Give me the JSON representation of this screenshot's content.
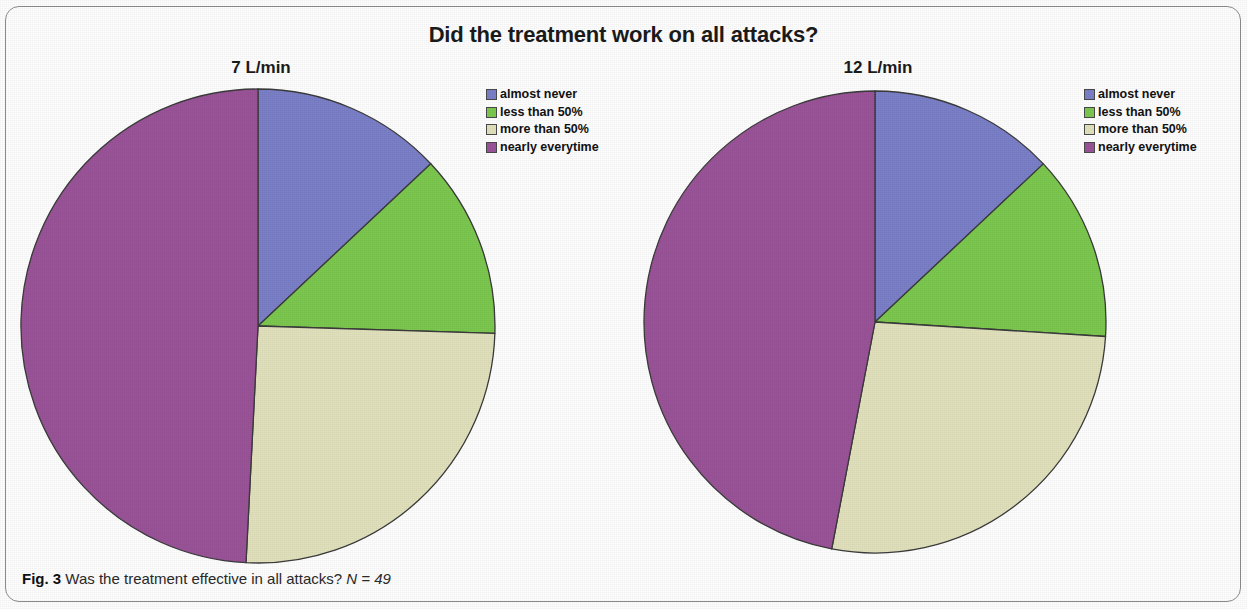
{
  "figure": {
    "title": "Did the treatment work on all attacks?",
    "caption_figure_label": "Fig. 3",
    "caption_text": "Was the treatment effective in all attacks?",
    "caption_n": "N = 49"
  },
  "colors": {
    "almost_never": "#7B80C9",
    "less_than_50": "#7CC94F",
    "more_than_50": "#E3E2BE",
    "nearly_everytime": "#9B5499",
    "slice_outline": "#3b3b3b",
    "title_color": "#1b1b1b",
    "frame_color": "#8d8d8d"
  },
  "legend": {
    "items": [
      {
        "label": "almost never",
        "color": "#7B80C9"
      },
      {
        "label": "less than 50%",
        "color": "#7CC94F"
      },
      {
        "label": "more than 50%",
        "color": "#E3E2BE"
      },
      {
        "label": "nearly everytime",
        "color": "#9B5499"
      }
    ]
  },
  "chart_data": [
    {
      "type": "pie",
      "title": "7 L/min",
      "subtitle": "7 L/min",
      "parent_title": "Did the treatment work on all attacks?",
      "categories": [
        "almost never",
        "less than 50%",
        "more than 50%",
        "nearly everytime"
      ],
      "colors": [
        "#7B80C9",
        "#7CC94F",
        "#E3E2BE",
        "#9B5499"
      ],
      "percentages": [
        13.0,
        12.5,
        25.3,
        49.2
      ],
      "angles_deg": [
        46.8,
        45.0,
        91.1,
        177.1
      ],
      "start_angle_deg": 0,
      "direction": "clockwise",
      "legend_position": "right",
      "grid": false
    },
    {
      "type": "pie",
      "title": "12 L/min",
      "subtitle": "12 L/min",
      "parent_title": "Did the treatment work on all attacks?",
      "categories": [
        "almost never",
        "less than 50%",
        "more than 50%",
        "nearly everytime"
      ],
      "colors": [
        "#7B80C9",
        "#7CC94F",
        "#E3E2BE",
        "#9B5499"
      ],
      "percentages": [
        13.0,
        13.0,
        27.0,
        47.0
      ],
      "angles_deg": [
        46.8,
        46.8,
        97.2,
        169.2
      ],
      "start_angle_deg": 0,
      "direction": "clockwise",
      "legend_position": "right",
      "grid": false
    }
  ]
}
